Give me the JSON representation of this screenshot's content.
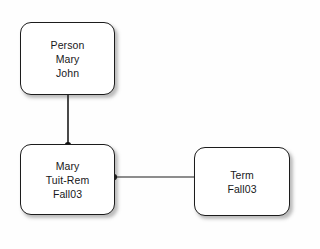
{
  "diagram": {
    "type": "entity-relationship-instance-diagram",
    "background_color": "#fefefe",
    "node_fill_color": "#ffffff",
    "node_border_color": "#1c1c1c",
    "text_color": "#18181a",
    "edge_color": "#1c1c1c",
    "nodes": [
      {
        "id": "person",
        "name": "person-node",
        "lines": [
          "Person",
          "Mary",
          "John"
        ],
        "x": 20,
        "y": 22,
        "width": 95,
        "height": 73
      },
      {
        "id": "enrollment",
        "name": "enrollment-node",
        "lines": [
          "Mary",
          "Tuit-Rem",
          "Fall03"
        ],
        "x": 20,
        "y": 144,
        "width": 95,
        "height": 71
      },
      {
        "id": "term",
        "name": "term-node",
        "lines": [
          "Term",
          "Fall03"
        ],
        "x": 194,
        "y": 147,
        "width": 96,
        "height": 69
      }
    ],
    "edges": [
      {
        "id": "person-to-enrollment",
        "name": "edge-person-enrollment",
        "from": "person",
        "to": "enrollment",
        "orientation": "vertical",
        "x1": 68,
        "y1": 95,
        "x2": 68,
        "y2": 145,
        "endpoint_dot": {
          "cx": 68,
          "cy": 145,
          "r": 3
        }
      },
      {
        "id": "enrollment-to-term",
        "name": "edge-enrollment-term",
        "from": "enrollment",
        "to": "term",
        "orientation": "horizontal",
        "x1": 114,
        "y1": 177,
        "x2": 194,
        "y2": 177,
        "endpoint_dot": {
          "cx": 114,
          "cy": 177,
          "r": 3
        }
      }
    ]
  }
}
